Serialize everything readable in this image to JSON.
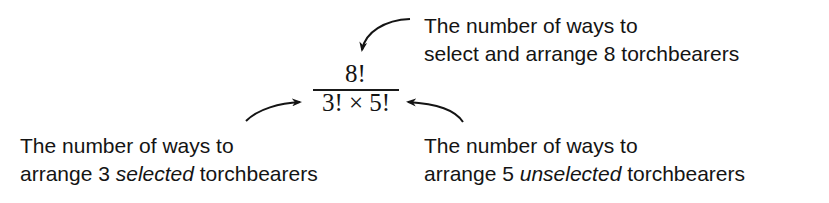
{
  "formula": {
    "numerator": "8!",
    "denominator": "3! × 5!"
  },
  "annotations": {
    "top_right": {
      "line1": "The number of ways to",
      "line2": "select and arrange 8 torchbearers"
    },
    "bottom_left": {
      "line1": "The number of ways to",
      "line2_pre": "arrange 3 ",
      "line2_em": "selected",
      "line2_post": " torchbearers"
    },
    "bottom_right": {
      "line1": "The number of ways to",
      "line2_pre": "arrange 5 ",
      "line2_em": "unselected",
      "line2_post": " torchbearers"
    }
  },
  "colors": {
    "text": "#141414",
    "background": "#ffffff"
  }
}
